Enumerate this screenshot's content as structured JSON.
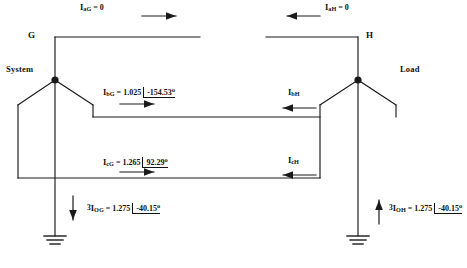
{
  "diagram": {
    "bus_left": {
      "name": "G",
      "side_label": "System"
    },
    "bus_right": {
      "name": "H",
      "side_label": "Load"
    },
    "ground_symbol": "ground-icon"
  },
  "currents": {
    "a_left": {
      "symbol": "I",
      "sub": "aG",
      "eq": "=",
      "value": "0",
      "angle": "",
      "deg": "",
      "arrow": "right"
    },
    "a_right": {
      "symbol": "I",
      "sub": "aH",
      "eq": "=",
      "value": "0",
      "angle": "",
      "deg": "",
      "arrow": "left"
    },
    "b_left": {
      "symbol": "I",
      "sub": "bG",
      "eq": "=",
      "value": "1.025",
      "angle": "-154.53",
      "deg": "o",
      "arrow": "right"
    },
    "b_right": {
      "symbol": "I",
      "sub": "bH",
      "eq": "",
      "value": "",
      "angle": "",
      "deg": "",
      "arrow": "left"
    },
    "c_left": {
      "symbol": "I",
      "sub": "cG",
      "eq": "=",
      "value": "1.265",
      "angle": "92.29",
      "deg": "o",
      "arrow": "right"
    },
    "c_right": {
      "symbol": "I",
      "sub": "cH",
      "eq": "",
      "value": "",
      "angle": "",
      "deg": "",
      "arrow": "left"
    },
    "zero_left": {
      "prefix": "3",
      "symbol": "I",
      "sub": "OG",
      "eq": "=",
      "value": "1.275",
      "angle": "-40.15",
      "deg": "o",
      "arrow": "down"
    },
    "zero_right": {
      "prefix": "3",
      "symbol": "I",
      "sub": "OH",
      "eq": "=",
      "value": "1.275",
      "angle": "-40.15",
      "deg": "o",
      "arrow": "up"
    }
  },
  "colors": {
    "line": "#111111",
    "background": "#ffffff",
    "text": "#111111"
  }
}
